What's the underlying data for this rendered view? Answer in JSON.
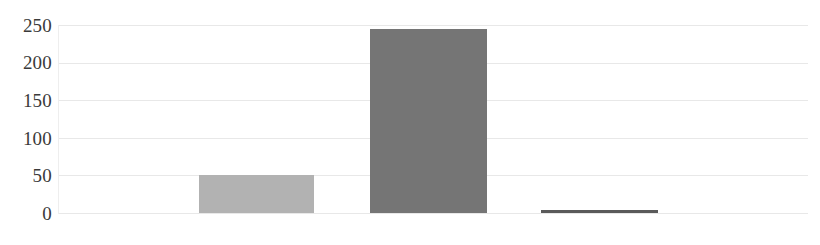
{
  "chart_data": {
    "type": "bar",
    "title": "",
    "subtitle": "",
    "xlabel": "",
    "ylabel": "",
    "categories": [
      "",
      "",
      ""
    ],
    "values": [
      50,
      245,
      4
    ],
    "ylim": [
      0,
      250
    ],
    "yticks": [
      0,
      50,
      100,
      150,
      200,
      250
    ],
    "ytick_labels": [
      "0",
      "50",
      "100",
      "150",
      "200",
      "250"
    ],
    "grid": true,
    "grid_axis": "y",
    "legend": false,
    "legend_position": "none",
    "annotations": [],
    "series": [
      {
        "name": "",
        "values": [
          50,
          245,
          4
        ],
        "colors": [
          "#b2b2b2",
          "#757575",
          "#5a5a5a"
        ]
      }
    ]
  },
  "style": {
    "background": "#ffffff",
    "gridline_color": "#e8e8e8",
    "axis_color": "#eeeeee",
    "tick_label_color": "#3a3a3a",
    "bar_colors": {
      "bar1": "#b2b2b2",
      "bar2": "#757575",
      "bar3": "#5a5a5a"
    }
  },
  "geometry": {
    "bars": [
      {
        "left": 140,
        "width": 115,
        "value": 50
      },
      {
        "left": 311,
        "width": 117,
        "value": 245
      },
      {
        "left": 482,
        "width": 117,
        "value": 4
      }
    ]
  }
}
